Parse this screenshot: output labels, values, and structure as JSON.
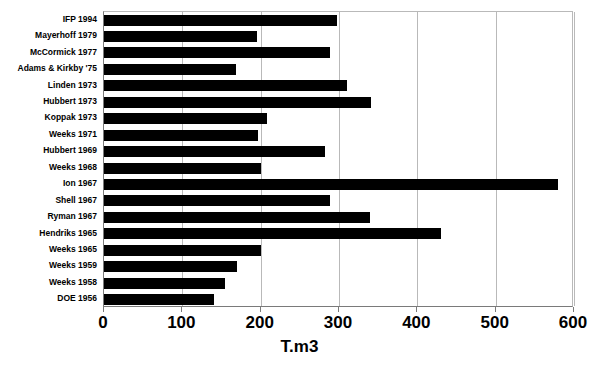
{
  "chart_data": {
    "type": "bar",
    "orientation": "horizontal",
    "title": "",
    "xlabel": "T.m3",
    "ylabel": "",
    "xlim": [
      0,
      600
    ],
    "xticks": [
      0,
      100,
      200,
      300,
      400,
      500,
      600
    ],
    "xtick_labels": [
      "0",
      "100",
      "200",
      "300",
      "400",
      "500",
      "600"
    ],
    "grid": true,
    "grid_axis": "x",
    "legend": false,
    "bar_color": "#000000",
    "categories": [
      "IFP 1994",
      "Mayerhoff 1979",
      "McCormick 1977",
      "Adams & Kirkby '75",
      "Linden 1973",
      "Hubbert 1973",
      "Koppak 1973",
      "Weeks 1971",
      "Hubbert 1969",
      "Weeks 1968",
      "Ion 1967",
      "Shell 1967",
      "Ryman 1967",
      "Hendriks 1965",
      "Weeks 1965",
      "Weeks 1959",
      "Weeks 1958",
      "DOE 1956"
    ],
    "values": [
      298,
      195,
      288,
      168,
      310,
      341,
      208,
      197,
      282,
      200,
      580,
      288,
      340,
      430,
      200,
      170,
      155,
      140
    ]
  }
}
